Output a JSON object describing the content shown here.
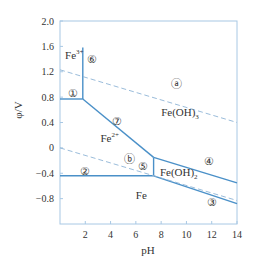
{
  "chart_data": {
    "type": "line",
    "title": "",
    "xlabel": "pH",
    "ylabel": "φ/V",
    "xlim": [
      0,
      14
    ],
    "ylim": [
      -1.2,
      2.0
    ],
    "x_ticks": [
      2,
      4,
      6,
      8,
      10,
      12,
      14
    ],
    "x_tick_labels": [
      "2",
      "4",
      "6",
      "8",
      "10",
      "12",
      "14"
    ],
    "y_ticks": [
      2.0,
      1.6,
      1.2,
      0.8,
      0.4,
      0,
      -0.4,
      -0.8
    ],
    "y_tick_labels": [
      "2.0",
      "1.6",
      "1.2",
      "0.8",
      "0.4",
      "0",
      "−0.4",
      "−0.8"
    ],
    "grid": false,
    "colors": {
      "line": "#4a90c8",
      "dashed": "#8fb4d6",
      "frame": "#a8c8e4",
      "text": "#333333"
    },
    "series": [
      {
        "name": "①",
        "style": "solid",
        "x": [
          0,
          1.8
        ],
        "y": [
          0.77,
          0.77
        ]
      },
      {
        "name": "⑥",
        "style": "solid",
        "x": [
          1.8,
          1.8
        ],
        "y": [
          0.77,
          1.58
        ]
      },
      {
        "name": "⑦",
        "style": "solid",
        "x": [
          1.8,
          7.4
        ],
        "y": [
          0.77,
          -0.15
        ]
      },
      {
        "name": "⑤",
        "style": "solid",
        "x": [
          7.4,
          7.4
        ],
        "y": [
          -0.15,
          -0.44
        ]
      },
      {
        "name": "②",
        "style": "solid",
        "x": [
          0,
          7.4
        ],
        "y": [
          -0.44,
          -0.44
        ]
      },
      {
        "name": "④",
        "style": "solid",
        "x": [
          7.4,
          14
        ],
        "y": [
          -0.15,
          -0.55
        ]
      },
      {
        "name": "③",
        "style": "solid",
        "x": [
          7.4,
          14
        ],
        "y": [
          -0.44,
          -0.88
        ]
      },
      {
        "name": "ⓐ",
        "style": "dashed",
        "x": [
          0,
          14
        ],
        "y": [
          1.23,
          0.4
        ]
      },
      {
        "name": "ⓑ",
        "style": "dashed",
        "x": [
          0,
          14
        ],
        "y": [
          0.0,
          -0.83
        ]
      }
    ],
    "line_markers": [
      {
        "label": "①",
        "x": 1.0,
        "y": 0.86
      },
      {
        "label": "⑥",
        "x": 2.5,
        "y": 1.4
      },
      {
        "label": "⑦",
        "x": 4.5,
        "y": 0.43
      },
      {
        "label": "⑤",
        "x": 6.6,
        "y": -0.29
      },
      {
        "label": "②",
        "x": 2.0,
        "y": -0.36
      },
      {
        "label": "④",
        "x": 11.8,
        "y": -0.2
      },
      {
        "label": "③",
        "x": 12.0,
        "y": -0.85
      },
      {
        "label": "ⓐ",
        "x": 9.2,
        "y": 1.0
      },
      {
        "label": "ⓑ",
        "x": 5.5,
        "y": -0.18
      }
    ],
    "annotations": [
      {
        "id": "fe3",
        "text": "Fe",
        "sup": "3+",
        "x": 0.4,
        "y": 1.4
      },
      {
        "id": "fe2",
        "text": "Fe",
        "sup": "2+",
        "x": 3.2,
        "y": 0.1
      },
      {
        "id": "feoh3",
        "text": "Fe(OH)",
        "sub": "3",
        "x": 8.0,
        "y": 0.5
      },
      {
        "id": "feoh2",
        "text": "Fe(OH)",
        "sub": "2",
        "x": 7.9,
        "y": -0.45
      },
      {
        "id": "fe",
        "text": "Fe",
        "x": 6.0,
        "y": -0.8
      }
    ]
  }
}
